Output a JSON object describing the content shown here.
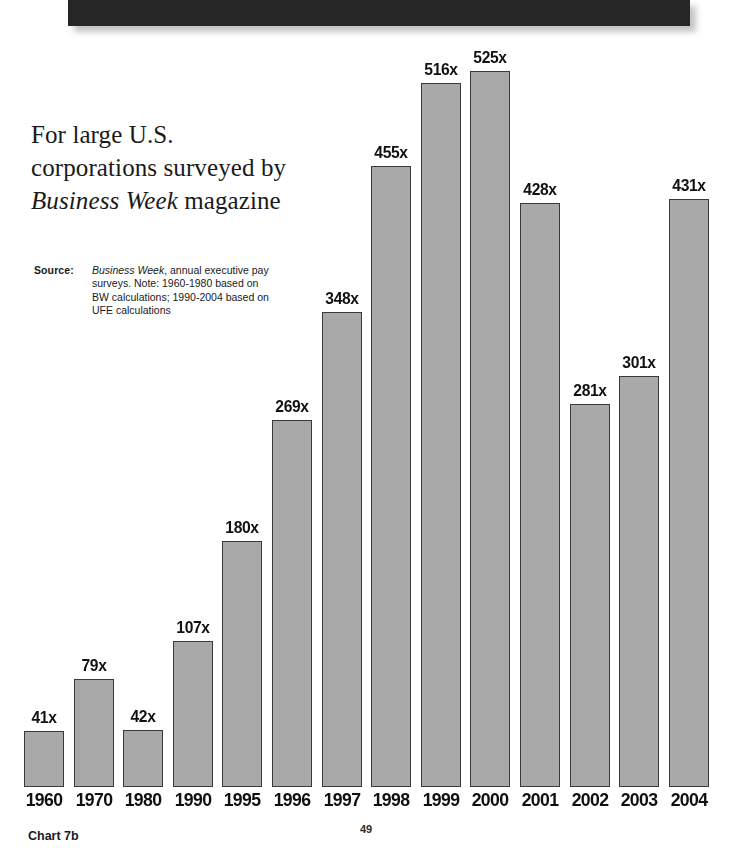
{
  "header": {
    "band": "black-bar"
  },
  "headline": {
    "line1": "For large U.S.",
    "line2": "corporations surveyed by",
    "line3_italic": "Business Week",
    "line3_rest": " magazine"
  },
  "source": {
    "label": "Source:",
    "publication": "Business Week",
    "text": ", annual executive pay surveys. Note: 1960-1980 based on BW calculations; 1990-2004 based on UFE calculations"
  },
  "footer": {
    "chart_id": "Chart 7b",
    "page_number": "49"
  },
  "chart_data": {
    "type": "bar",
    "title": "For large U.S. corporations surveyed by Business Week magazine",
    "xlabel": "",
    "ylabel": "",
    "ylim": [
      0,
      525
    ],
    "grid": false,
    "legend": "none",
    "bar_color": "#a9a9a9",
    "bar_outline_color": "#3a3a3a",
    "value_suffix": "x",
    "categories": [
      "1960",
      "1970",
      "1980",
      "1990",
      "1995",
      "1996",
      "1997",
      "1998",
      "1999",
      "2000",
      "2001",
      "2002",
      "2003",
      "2004"
    ],
    "values": [
      41,
      79,
      42,
      107,
      180,
      269,
      348,
      455,
      516,
      525,
      428,
      281,
      301,
      431
    ],
    "labels": [
      "41x",
      "79x",
      "42x",
      "107x",
      "180x",
      "269x",
      "348x",
      "455x",
      "516x",
      "525x",
      "428x",
      "281x",
      "301x",
      "431x"
    ]
  }
}
